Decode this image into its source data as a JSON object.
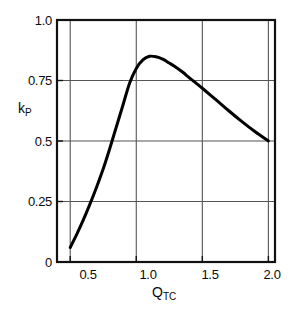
{
  "chart_data": {
    "type": "line",
    "title": "",
    "subtitle": "",
    "xlabel": "Q_TC",
    "xlabel_base": "Q",
    "xlabel_sub": "TC",
    "ylabel": "k_P",
    "ylabel_base": "k",
    "ylabel_sub": "P",
    "xlim": [
      0.4,
      2.05
    ],
    "ylim": [
      0.0,
      1.0
    ],
    "xticks": [
      0.5,
      1.0,
      1.5,
      2.0
    ],
    "xtick_labels": [
      "0.5",
      "1.0",
      "1.5",
      "2.0"
    ],
    "yticks": [
      0,
      0.25,
      0.5,
      0.75,
      1.0
    ],
    "ytick_labels": [
      "0",
      "0.25",
      "0.5",
      "0.75",
      "1.0"
    ],
    "grid": true,
    "grid_color": "#555555",
    "frame_color": "#111111",
    "line_color": "#000000",
    "line_width": 3,
    "legend": null,
    "series": [
      {
        "name": "k_P vs Q_TC",
        "x": [
          0.5,
          0.55,
          0.6,
          0.65,
          0.7,
          0.75,
          0.8,
          0.85,
          0.9,
          0.95,
          1.0,
          1.05,
          1.1,
          1.15,
          1.2,
          1.25,
          1.3,
          1.35,
          1.4,
          1.45,
          1.5,
          1.6,
          1.7,
          1.8,
          1.9,
          2.0
        ],
        "y": [
          0.06,
          0.115,
          0.175,
          0.24,
          0.31,
          0.385,
          0.47,
          0.56,
          0.65,
          0.74,
          0.8,
          0.835,
          0.85,
          0.848,
          0.838,
          0.822,
          0.805,
          0.785,
          0.762,
          0.74,
          0.718,
          0.672,
          0.625,
          0.58,
          0.538,
          0.5
        ]
      }
    ],
    "annotations": [
      {
        "text": "peak",
        "x": 1.1,
        "y": 0.85
      }
    ]
  }
}
